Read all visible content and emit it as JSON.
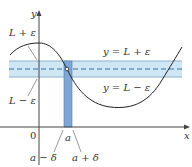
{
  "diagram": {
    "colors": {
      "band": "#cfe6f5",
      "band_edge": "#7fa6c4",
      "vertical_band": "#7ea7d6",
      "curve": "#222222",
      "axis": "#444444",
      "dashed": "#3a6ea5"
    },
    "axes": {
      "x_label": "x",
      "y_label": "y",
      "origin_label": "0"
    },
    "left_labels": {
      "upper": "L + ε",
      "lower": "L − ε"
    },
    "band_labels": {
      "upper_line": "y = L + ε",
      "lower_line": "y = L − ε"
    },
    "x_labels": {
      "a": "a",
      "a_minus_delta": "a − δ",
      "a_plus_delta": "a + δ"
    }
  }
}
